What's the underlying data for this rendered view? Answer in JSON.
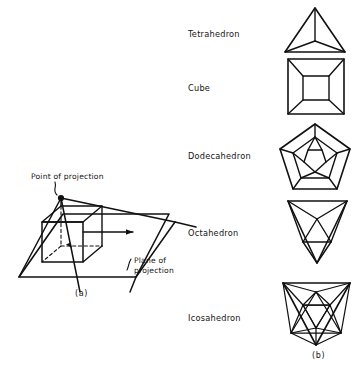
{
  "figure": {
    "panel_a": {
      "caption": "(a)",
      "labels": {
        "point_of_projection": "Point of projection",
        "plane_of_projection_line1": "Plane of",
        "plane_of_projection_line2": "projection"
      }
    },
    "panel_b": {
      "caption": "(b)",
      "solids": [
        {
          "name": "Tetrahedron"
        },
        {
          "name": "Cube"
        },
        {
          "name": "Dodecahedron"
        },
        {
          "name": "Octahedron"
        },
        {
          "name": "Icosahedron"
        }
      ]
    },
    "colors": {
      "ink": "#111111",
      "background": "#ffffff"
    }
  }
}
